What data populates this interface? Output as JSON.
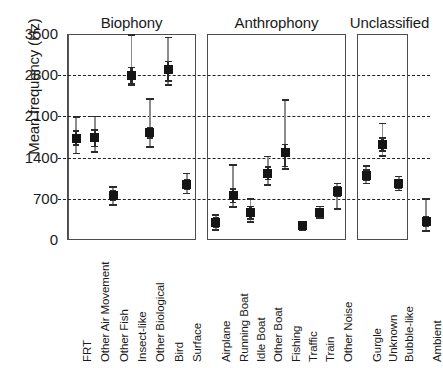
{
  "chart_data": {
    "type": "scatter",
    "title": "",
    "xlabel": "",
    "ylabel": "Mean frequency (Hz)",
    "ylim": [
      0,
      3500
    ],
    "yticks": [
      0,
      700,
      1400,
      2100,
      2800,
      3500
    ],
    "ytick_labels": [
      "0",
      "700",
      "1400",
      "2100",
      "2800",
      "3500"
    ],
    "gridlines": [
      700,
      1400,
      2100,
      2800
    ],
    "grid": true,
    "legend": "none",
    "error_style": "mean with inner SE bar and outer range whisker",
    "groups": [
      {
        "name": "Biophony",
        "categories": [
          "FRT",
          "Other Air Movement",
          "Other Fish",
          "Insect-like",
          "Other Biological",
          "Bird",
          "Surface"
        ],
        "values": [
          1730,
          1740,
          760,
          2800,
          1820,
          2890,
          940
        ],
        "inner_low": [
          1610,
          1590,
          680,
          2660,
          1730,
          2700,
          860
        ],
        "inner_high": [
          1850,
          1870,
          840,
          2930,
          1910,
          3030,
          1030
        ],
        "outer_low": [
          1470,
          1490,
          600,
          2640,
          1580,
          2640,
          790
        ],
        "outer_high": [
          2090,
          2100,
          900,
          3480,
          2400,
          3440,
          1130
        ]
      },
      {
        "name": "Anthrophony",
        "categories": [
          "Airplane",
          "Running Boat",
          "Idle Boat",
          "Other Boat",
          "Fishing",
          "Traffic",
          "Train",
          "Other Noise"
        ],
        "values": [
          290,
          750,
          460,
          1130,
          1490,
          240,
          460,
          820
        ],
        "inner_low": [
          215,
          640,
          355,
          1030,
          1250,
          195,
          400,
          740
        ],
        "inner_high": [
          370,
          870,
          570,
          1240,
          1620,
          290,
          530,
          910
        ],
        "outer_low": [
          165,
          560,
          300,
          930,
          1200,
          175,
          370,
          520
        ],
        "outer_high": [
          430,
          1280,
          700,
          1420,
          2380,
          310,
          570,
          960
        ]
      },
      {
        "name": "Unclassified",
        "categories": [
          "Gurgle",
          "Unknown",
          "Bubble-like",
          "Ambient"
        ],
        "values": [
          1095,
          1620,
          955,
          310
        ],
        "inner_low": [
          1010,
          1510,
          880,
          230
        ],
        "inner_high": [
          1190,
          1730,
          1030,
          400
        ],
        "outer_low": [
          960,
          1430,
          840,
          150
        ],
        "outer_high": [
          1260,
          1980,
          1080,
          690
        ]
      }
    ]
  },
  "axis": {
    "y_title": "Mean frequency (Hz)"
  },
  "panel_titles": {
    "biophony": "Biophony",
    "anthrophony": "Anthrophony",
    "unclassified": "Unclassified"
  },
  "colors": {
    "marker": "#151515",
    "whisker": "#8c8c8c",
    "inner_bar": "#2b2b2b",
    "panel_border": "#4d4d4d",
    "gridline": "#222222",
    "background": "#ffffff"
  }
}
